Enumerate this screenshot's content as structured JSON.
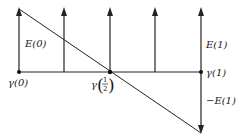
{
  "diagram": {
    "type": "vector-field-along-path",
    "colors": {
      "stroke": "#222222",
      "background": "#ffffff"
    },
    "baseline": {
      "y": 72,
      "x_start": 19,
      "x_end": 201
    },
    "points": [
      {
        "id": "gamma-0",
        "label_sym": "γ",
        "label_arg": "(0)",
        "x": 19,
        "y": 72
      },
      {
        "id": "gamma-half",
        "label_sym": "γ",
        "label_arg_num": "1",
        "label_arg_den": "2",
        "x": 110,
        "y": 72
      },
      {
        "id": "gamma-1",
        "label_sym": "γ",
        "label_arg": "(1)",
        "x": 201,
        "y": 72
      }
    ],
    "up_arrows_x": [
      19,
      64,
      110,
      155,
      201
    ],
    "up_arrow_tip_y": 8,
    "down_arrow": {
      "x": 201,
      "tip_y": 134
    },
    "diagonal": {
      "x1": 19,
      "y1": 10,
      "x2": 201,
      "y2": 133
    },
    "labels": {
      "e0": "E(0)",
      "e1": "E(1)",
      "neg_e1": "−E(1)",
      "gamma0_sym": "γ",
      "gamma0_arg": "(0)",
      "gamma1_sym": "γ",
      "gamma1_arg": "(1)",
      "gamma_half_sym": "γ",
      "half_num": "1",
      "half_den": "2",
      "paren_open": "(",
      "paren_close": ")"
    }
  }
}
